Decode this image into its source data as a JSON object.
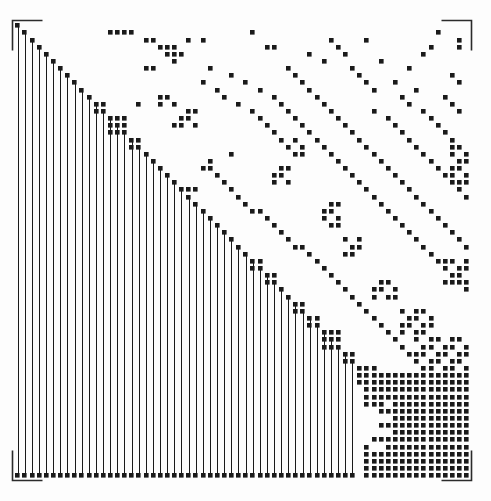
{
  "figure": {
    "type": "sparse-matrix-spy-plot",
    "page_label": "151",
    "background_color": "#fdfdfd",
    "marker_color": "#1a1a1a",
    "frame_color": "#2b2b2b",
    "width": 491,
    "height": 501
  },
  "axes": {
    "x0": 14,
    "y0": 22,
    "x1": 470,
    "y1": 479,
    "bracket_length": 30,
    "frame_style": "corner-brackets",
    "tick_labels_x": [],
    "tick_labels_y": [],
    "xlabel": "",
    "ylabel": "",
    "title": ""
  },
  "chart_data": {
    "type": "heatmap",
    "title": "",
    "subtitle": "",
    "xlabel": "",
    "ylabel": "",
    "legend": [],
    "grid": false,
    "n_rows": 64,
    "n_cols": 64,
    "xlim": [
      0,
      64
    ],
    "ylim": [
      0,
      64
    ],
    "cell_w": 7.125,
    "cell_h": 7.14,
    "marker_size": 4.6,
    "staircase_blocks": [
      {
        "row": 0,
        "col": 0,
        "w": 1,
        "h": 1
      },
      {
        "row": 1,
        "col": 1,
        "w": 1,
        "h": 1
      },
      {
        "row": 2,
        "col": 2,
        "w": 1,
        "h": 1
      },
      {
        "row": 3,
        "col": 3,
        "w": 1,
        "h": 1
      },
      {
        "row": 4,
        "col": 4,
        "w": 1,
        "h": 1
      },
      {
        "row": 5,
        "col": 5,
        "w": 1,
        "h": 1
      },
      {
        "row": 6,
        "col": 6,
        "w": 1,
        "h": 1
      },
      {
        "row": 7,
        "col": 7,
        "w": 1,
        "h": 1
      },
      {
        "row": 8,
        "col": 8,
        "w": 1,
        "h": 1
      },
      {
        "row": 9,
        "col": 9,
        "w": 1,
        "h": 1
      },
      {
        "row": 10,
        "col": 10,
        "w": 1,
        "h": 1
      },
      {
        "row": 11,
        "col": 11,
        "w": 2,
        "h": 2
      },
      {
        "row": 13,
        "col": 13,
        "w": 3,
        "h": 3
      },
      {
        "row": 16,
        "col": 16,
        "w": 2,
        "h": 2
      },
      {
        "row": 18,
        "col": 18,
        "w": 1,
        "h": 1
      },
      {
        "row": 19,
        "col": 19,
        "w": 1,
        "h": 1
      },
      {
        "row": 20,
        "col": 20,
        "w": 1,
        "h": 1
      },
      {
        "row": 21,
        "col": 21,
        "w": 1,
        "h": 1
      },
      {
        "row": 22,
        "col": 22,
        "w": 1,
        "h": 1
      },
      {
        "row": 23,
        "col": 23,
        "w": 1,
        "h": 1
      },
      {
        "row": 24,
        "col": 24,
        "w": 1,
        "h": 1
      },
      {
        "row": 25,
        "col": 25,
        "w": 1,
        "h": 1
      },
      {
        "row": 26,
        "col": 26,
        "w": 1,
        "h": 1
      },
      {
        "row": 27,
        "col": 27,
        "w": 1,
        "h": 1
      },
      {
        "row": 28,
        "col": 28,
        "w": 1,
        "h": 1
      },
      {
        "row": 29,
        "col": 29,
        "w": 1,
        "h": 1
      },
      {
        "row": 30,
        "col": 30,
        "w": 1,
        "h": 1
      },
      {
        "row": 31,
        "col": 31,
        "w": 1,
        "h": 1
      },
      {
        "row": 32,
        "col": 32,
        "w": 1,
        "h": 1
      },
      {
        "row": 33,
        "col": 33,
        "w": 2,
        "h": 2
      },
      {
        "row": 35,
        "col": 35,
        "w": 2,
        "h": 2
      },
      {
        "row": 37,
        "col": 37,
        "w": 1,
        "h": 1
      },
      {
        "row": 38,
        "col": 38,
        "w": 1,
        "h": 1
      },
      {
        "row": 39,
        "col": 39,
        "w": 2,
        "h": 2
      },
      {
        "row": 41,
        "col": 41,
        "w": 2,
        "h": 2
      },
      {
        "row": 43,
        "col": 43,
        "w": 3,
        "h": 3
      },
      {
        "row": 46,
        "col": 46,
        "w": 2,
        "h": 2
      },
      {
        "row": 48,
        "col": 48,
        "w": 3,
        "h": 3
      },
      {
        "row": 51,
        "col": 51,
        "w": 2,
        "h": 2
      },
      {
        "row": 53,
        "col": 53,
        "w": 2,
        "h": 2
      },
      {
        "row": 55,
        "col": 55,
        "w": 2,
        "h": 2
      },
      {
        "row": 57,
        "col": 57,
        "w": 2,
        "h": 2
      },
      {
        "row": 59,
        "col": 59,
        "w": 5,
        "h": 5
      }
    ],
    "column_bands": [
      {
        "col": 0,
        "row_start": 0,
        "row_end": 63
      },
      {
        "col": 1,
        "row_start": 1,
        "row_end": 63
      },
      {
        "col": 2,
        "row_start": 2,
        "row_end": 63
      },
      {
        "col": 3,
        "row_start": 3,
        "row_end": 63
      },
      {
        "col": 4,
        "row_start": 4,
        "row_end": 63
      },
      {
        "col": 5,
        "row_start": 5,
        "row_end": 63
      },
      {
        "col": 6,
        "row_start": 6,
        "row_end": 63
      },
      {
        "col": 7,
        "row_start": 7,
        "row_end": 63
      },
      {
        "col": 8,
        "row_start": 8,
        "row_end": 63
      },
      {
        "col": 9,
        "row_start": 9,
        "row_end": 63
      },
      {
        "col": 10,
        "row_start": 10,
        "row_end": 63
      },
      {
        "col": 11,
        "row_start": 11,
        "row_end": 63
      },
      {
        "col": 12,
        "row_start": 12,
        "row_end": 63
      },
      {
        "col": 13,
        "row_start": 13,
        "row_end": 63
      },
      {
        "col": 14,
        "row_start": 14,
        "row_end": 63
      },
      {
        "col": 15,
        "row_start": 15,
        "row_end": 63
      },
      {
        "col": 16,
        "row_start": 16,
        "row_end": 63
      },
      {
        "col": 17,
        "row_start": 17,
        "row_end": 63
      },
      {
        "col": 18,
        "row_start": 18,
        "row_end": 63
      },
      {
        "col": 19,
        "row_start": 19,
        "row_end": 63
      },
      {
        "col": 20,
        "row_start": 20,
        "row_end": 63
      },
      {
        "col": 21,
        "row_start": 21,
        "row_end": 63
      },
      {
        "col": 22,
        "row_start": 22,
        "row_end": 63
      },
      {
        "col": 23,
        "row_start": 23,
        "row_end": 63
      },
      {
        "col": 24,
        "row_start": 24,
        "row_end": 63
      },
      {
        "col": 25,
        "row_start": 25,
        "row_end": 63
      },
      {
        "col": 26,
        "row_start": 26,
        "row_end": 63
      },
      {
        "col": 27,
        "row_start": 27,
        "row_end": 63
      },
      {
        "col": 28,
        "row_start": 28,
        "row_end": 63
      },
      {
        "col": 29,
        "row_start": 29,
        "row_end": 63
      },
      {
        "col": 30,
        "row_start": 30,
        "row_end": 63
      },
      {
        "col": 31,
        "row_start": 31,
        "row_end": 63
      },
      {
        "col": 32,
        "row_start": 32,
        "row_end": 63
      },
      {
        "col": 33,
        "row_start": 33,
        "row_end": 63
      },
      {
        "col": 34,
        "row_start": 34,
        "row_end": 63
      },
      {
        "col": 35,
        "row_start": 35,
        "row_end": 63
      },
      {
        "col": 36,
        "row_start": 36,
        "row_end": 63
      },
      {
        "col": 37,
        "row_start": 37,
        "row_end": 63
      },
      {
        "col": 38,
        "row_start": 38,
        "row_end": 63
      },
      {
        "col": 39,
        "row_start": 39,
        "row_end": 63
      },
      {
        "col": 40,
        "row_start": 40,
        "row_end": 63
      },
      {
        "col": 41,
        "row_start": 41,
        "row_end": 63
      },
      {
        "col": 42,
        "row_start": 42,
        "row_end": 63
      },
      {
        "col": 43,
        "row_start": 43,
        "row_end": 63
      },
      {
        "col": 44,
        "row_start": 44,
        "row_end": 63
      },
      {
        "col": 45,
        "row_start": 45,
        "row_end": 63
      },
      {
        "col": 46,
        "row_start": 46,
        "row_end": 63
      },
      {
        "col": 47,
        "row_start": 47,
        "row_end": 63
      }
    ],
    "dense_block": {
      "row_start": 49,
      "row_end": 63,
      "col_start": 49,
      "col_end": 63
    },
    "dense_block_holes": [
      {
        "row": 54,
        "col": 49,
        "w": 2,
        "h": 4
      },
      {
        "row": 55,
        "col": 51,
        "w": 2,
        "h": 1
      },
      {
        "row": 57,
        "col": 51,
        "w": 2,
        "h": 1
      },
      {
        "row": 58,
        "col": 49,
        "w": 1,
        "h": 1
      },
      {
        "row": 59,
        "col": 50,
        "w": 2,
        "h": 1
      },
      {
        "row": 53,
        "col": 52,
        "w": 1,
        "h": 1
      }
    ],
    "scatter_nonzeros": [
      [
        1,
        13
      ],
      [
        1,
        14
      ],
      [
        1,
        15
      ],
      [
        1,
        16
      ],
      [
        1,
        33
      ],
      [
        1,
        59
      ],
      [
        2,
        18
      ],
      [
        2,
        19
      ],
      [
        2,
        24
      ],
      [
        2,
        26
      ],
      [
        2,
        44
      ],
      [
        2,
        49
      ],
      [
        2,
        62
      ],
      [
        3,
        20
      ],
      [
        3,
        21
      ],
      [
        3,
        22
      ],
      [
        3,
        35
      ],
      [
        3,
        36
      ],
      [
        3,
        45
      ],
      [
        3,
        58
      ],
      [
        3,
        62
      ],
      [
        4,
        21
      ],
      [
        4,
        22
      ],
      [
        4,
        23
      ],
      [
        4,
        41
      ],
      [
        4,
        46
      ],
      [
        4,
        57
      ],
      [
        5,
        22
      ],
      [
        5,
        43
      ],
      [
        5,
        51
      ],
      [
        6,
        18
      ],
      [
        6,
        19
      ],
      [
        6,
        27
      ],
      [
        6,
        38
      ],
      [
        6,
        47
      ],
      [
        6,
        55
      ],
      [
        7,
        30
      ],
      [
        7,
        39
      ],
      [
        7,
        48
      ],
      [
        7,
        61
      ],
      [
        8,
        26
      ],
      [
        8,
        32
      ],
      [
        8,
        40
      ],
      [
        8,
        49
      ],
      [
        8,
        53
      ],
      [
        8,
        62
      ],
      [
        9,
        28
      ],
      [
        9,
        34
      ],
      [
        9,
        41
      ],
      [
        9,
        50
      ],
      [
        9,
        56
      ],
      [
        10,
        29
      ],
      [
        10,
        36
      ],
      [
        10,
        42
      ],
      [
        10,
        54
      ],
      [
        10,
        60
      ],
      [
        11,
        17
      ],
      [
        11,
        31
      ],
      [
        11,
        37
      ],
      [
        11,
        43
      ],
      [
        11,
        55
      ],
      [
        11,
        61
      ],
      [
        12,
        33
      ],
      [
        12,
        38
      ],
      [
        12,
        44
      ],
      [
        12,
        50
      ],
      [
        12,
        57
      ],
      [
        12,
        62
      ],
      [
        13,
        34
      ],
      [
        13,
        39
      ],
      [
        13,
        45
      ],
      [
        13,
        52
      ],
      [
        13,
        58
      ],
      [
        14,
        22
      ],
      [
        14,
        35
      ],
      [
        14,
        40
      ],
      [
        14,
        46
      ],
      [
        14,
        53
      ],
      [
        14,
        59
      ],
      [
        15,
        36
      ],
      [
        15,
        41
      ],
      [
        15,
        47
      ],
      [
        15,
        54
      ],
      [
        15,
        60
      ],
      [
        16,
        17
      ],
      [
        16,
        37
      ],
      [
        16,
        42
      ],
      [
        16,
        48
      ],
      [
        16,
        55
      ],
      [
        16,
        61
      ],
      [
        17,
        38
      ],
      [
        17,
        43
      ],
      [
        17,
        49
      ],
      [
        17,
        56
      ],
      [
        17,
        62
      ],
      [
        18,
        30
      ],
      [
        18,
        44
      ],
      [
        18,
        50
      ],
      [
        18,
        57
      ],
      [
        18,
        63
      ],
      [
        19,
        27
      ],
      [
        19,
        45
      ],
      [
        19,
        51
      ],
      [
        19,
        58
      ],
      [
        20,
        26
      ],
      [
        20,
        27
      ],
      [
        20,
        46
      ],
      [
        20,
        52
      ],
      [
        20,
        59
      ],
      [
        21,
        28
      ],
      [
        21,
        47
      ],
      [
        21,
        53
      ],
      [
        21,
        60
      ],
      [
        22,
        29
      ],
      [
        22,
        48
      ],
      [
        22,
        54
      ],
      [
        22,
        61
      ],
      [
        23,
        24
      ],
      [
        23,
        25
      ],
      [
        23,
        30
      ],
      [
        23,
        49
      ],
      [
        23,
        55
      ],
      [
        23,
        62
      ],
      [
        24,
        31
      ],
      [
        24,
        50
      ],
      [
        24,
        56
      ],
      [
        24,
        63
      ],
      [
        25,
        32
      ],
      [
        25,
        51
      ],
      [
        25,
        57
      ],
      [
        26,
        33
      ],
      [
        26,
        34
      ],
      [
        26,
        52
      ],
      [
        26,
        58
      ],
      [
        27,
        35
      ],
      [
        27,
        53
      ],
      [
        27,
        59
      ],
      [
        28,
        36
      ],
      [
        28,
        54
      ],
      [
        28,
        60
      ],
      [
        29,
        37
      ],
      [
        29,
        55
      ],
      [
        29,
        61
      ],
      [
        30,
        38
      ],
      [
        30,
        56
      ],
      [
        30,
        62
      ],
      [
        31,
        39
      ],
      [
        31,
        40
      ],
      [
        31,
        57
      ],
      [
        31,
        63
      ],
      [
        32,
        41
      ],
      [
        32,
        58
      ],
      [
        33,
        42
      ],
      [
        33,
        59
      ],
      [
        34,
        43
      ],
      [
        34,
        60
      ],
      [
        35,
        44
      ],
      [
        35,
        61
      ],
      [
        36,
        45
      ],
      [
        36,
        62
      ],
      [
        37,
        46
      ],
      [
        37,
        63
      ],
      [
        38,
        47
      ],
      [
        39,
        48
      ],
      [
        40,
        49
      ],
      [
        41,
        50
      ],
      [
        42,
        51
      ],
      [
        43,
        52
      ],
      [
        44,
        53
      ],
      [
        45,
        54
      ],
      [
        46,
        55
      ],
      [
        47,
        56
      ]
    ],
    "scatter_clusters": [
      {
        "row_start": 1,
        "row_end": 1,
        "col_start": 13,
        "col_end": 16
      },
      {
        "row_start": 10,
        "row_end": 11,
        "col_start": 20,
        "col_end": 22
      },
      {
        "row_start": 12,
        "row_end": 14,
        "col_start": 23,
        "col_end": 25
      },
      {
        "row_start": 16,
        "row_end": 18,
        "col_start": 39,
        "col_end": 40
      },
      {
        "row_start": 20,
        "row_end": 22,
        "col_start": 36,
        "col_end": 38
      },
      {
        "row_start": 25,
        "row_end": 28,
        "col_start": 43,
        "col_end": 45
      },
      {
        "row_start": 30,
        "row_end": 32,
        "col_start": 46,
        "col_end": 48
      },
      {
        "row_start": 36,
        "row_end": 38,
        "col_start": 50,
        "col_end": 53
      },
      {
        "row_start": 40,
        "row_end": 43,
        "col_start": 54,
        "col_end": 58
      },
      {
        "row_start": 44,
        "row_end": 48,
        "col_start": 56,
        "col_end": 63
      },
      {
        "row_start": 17,
        "row_end": 22,
        "col_start": 61,
        "col_end": 63
      },
      {
        "row_start": 33,
        "row_end": 36,
        "col_start": 60,
        "col_end": 63
      }
    ]
  }
}
